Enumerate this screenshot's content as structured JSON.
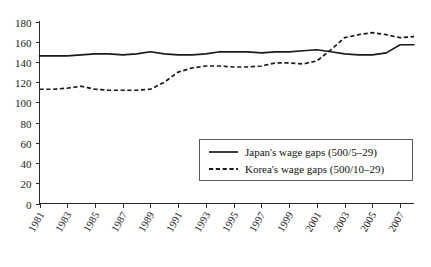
{
  "chart_data": {
    "type": "line",
    "title": "",
    "subtitle": "",
    "xlabel": "",
    "ylabel": "",
    "grid": false,
    "legend_position": "inside-center-right",
    "ylim": [
      0,
      180
    ],
    "ytick_step": 20,
    "yticks": [
      "0",
      "20",
      "40",
      "60",
      "80",
      "100",
      "120",
      "140",
      "160",
      "180"
    ],
    "xlim": [
      1981,
      2008
    ],
    "xticks": [
      "1981",
      "1983",
      "1985",
      "1987",
      "1989",
      "1991",
      "1993",
      "1995",
      "1997",
      "1999",
      "2001",
      "2003",
      "2005",
      "2007"
    ],
    "x": [
      1981,
      1982,
      1983,
      1984,
      1985,
      1986,
      1987,
      1988,
      1989,
      1990,
      1991,
      1992,
      1993,
      1994,
      1995,
      1996,
      1997,
      1998,
      1999,
      2000,
      2001,
      2002,
      2003,
      2004,
      2005,
      2006,
      2007,
      2008
    ],
    "series": [
      {
        "name": "Japan's wage gaps (500/5–29)",
        "style": "solid",
        "color": "#1a1a1a",
        "values": [
          146,
          146,
          146,
          147,
          148,
          148,
          147,
          148,
          150,
          148,
          147,
          147,
          148,
          150,
          150,
          150,
          149,
          150,
          150,
          151,
          152,
          150,
          148,
          147,
          147,
          149,
          157,
          157
        ]
      },
      {
        "name": "Korea's wage gaps (500/10–29)",
        "style": "dashed",
        "color": "#1a1a1a",
        "values": [
          113,
          113,
          114,
          116,
          113,
          112,
          112,
          112,
          113,
          120,
          130,
          134,
          136,
          136,
          135,
          135,
          136,
          139,
          139,
          138,
          141,
          152,
          164,
          167,
          169,
          167,
          164,
          165
        ]
      }
    ],
    "legend_entries": [
      {
        "label": "Japan's wage gaps (500/5–29)",
        "style": "solid"
      },
      {
        "label": "Korea's wage gaps (500/10–29)",
        "style": "dashed"
      }
    ]
  }
}
